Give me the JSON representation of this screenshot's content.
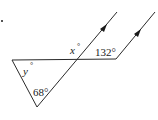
{
  "diagram": {
    "type": "geometry-angles",
    "labels": {
      "x": "x",
      "y": "y",
      "angle_132": "132°",
      "angle_68": "68°",
      "degree": "°"
    },
    "colors": {
      "stroke": "#2a2a2a",
      "background": "#ffffff"
    },
    "parallel_markers": 2
  }
}
